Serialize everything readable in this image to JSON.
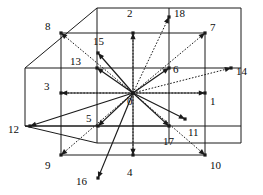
{
  "figure": {
    "name": "3d-lattice-neighborhood-graph",
    "type": "diagram",
    "background_color": "#ffffff",
    "line_color": "#1a1a1a",
    "label_color": "#0d0d0d",
    "center_node": "0",
    "projection": {
      "depth_dx": 36,
      "depth_dy": -25,
      "cell": 36
    },
    "node_count": 19
  },
  "nodes": [
    {
      "id": "0",
      "label": "0",
      "x": 133,
      "y": 93,
      "lx": 127,
      "ly": 96,
      "marker": true
    },
    {
      "id": "1",
      "label": "1",
      "x": 205,
      "y": 93,
      "lx": 210,
      "ly": 96,
      "marker": true
    },
    {
      "id": "2",
      "label": "2",
      "x": 133,
      "y": 33,
      "lx": 127,
      "ly": 8,
      "marker": true
    },
    {
      "id": "3",
      "label": "3",
      "x": 61,
      "y": 93,
      "lx": 44,
      "ly": 81,
      "marker": true
    },
    {
      "id": "4",
      "label": "4",
      "x": 133,
      "y": 155,
      "lx": 127,
      "ly": 167,
      "marker": true
    },
    {
      "id": "5",
      "label": "5",
      "x": 98,
      "y": 126,
      "lx": 86,
      "ly": 113,
      "marker": true
    },
    {
      "id": "6",
      "label": "6",
      "x": 169,
      "y": 68,
      "lx": 173,
      "ly": 64,
      "marker": true
    },
    {
      "id": "7",
      "label": "7",
      "x": 205,
      "y": 33,
      "lx": 210,
      "ly": 22,
      "marker": true
    },
    {
      "id": "8",
      "label": "8",
      "x": 61,
      "y": 33,
      "lx": 45,
      "ly": 21,
      "marker": true
    },
    {
      "id": "9",
      "label": "9",
      "x": 61,
      "y": 155,
      "lx": 45,
      "ly": 160,
      "marker": true
    },
    {
      "id": "10",
      "label": "10",
      "x": 205,
      "y": 155,
      "lx": 210,
      "ly": 160,
      "marker": true
    },
    {
      "id": "11",
      "label": "11",
      "x": 185,
      "y": 119,
      "lx": 188,
      "ly": 127,
      "marker": true
    },
    {
      "id": "12",
      "label": "12",
      "x": 30,
      "y": 126,
      "lx": 8,
      "ly": 124,
      "marker": true
    },
    {
      "id": "13",
      "label": "13",
      "x": 97,
      "y": 68,
      "lx": 70,
      "ly": 56,
      "marker": true
    },
    {
      "id": "14",
      "label": "14",
      "x": 231,
      "y": 68,
      "lx": 236,
      "ly": 66,
      "marker": true
    },
    {
      "id": "15",
      "label": "15",
      "x": 98,
      "y": 53,
      "lx": 93,
      "ly": 36,
      "marker": true
    },
    {
      "id": "16",
      "label": "16",
      "x": 98,
      "y": 178,
      "lx": 76,
      "ly": 176,
      "marker": true
    },
    {
      "id": "17",
      "label": "17",
      "x": 169,
      "y": 126,
      "lx": 163,
      "ly": 136,
      "marker": true
    },
    {
      "id": "18",
      "label": "18",
      "x": 169,
      "y": 17,
      "lx": 174,
      "ly": 8,
      "marker": true
    }
  ],
  "frame_edges": [
    {
      "from": [
        61,
        33
      ],
      "to": [
        205,
        33
      ],
      "style": "solid"
    },
    {
      "from": [
        61,
        33
      ],
      "to": [
        61,
        155
      ],
      "style": "solid"
    },
    {
      "from": [
        205,
        33
      ],
      "to": [
        205,
        155
      ],
      "style": "solid"
    },
    {
      "from": [
        61,
        155
      ],
      "to": [
        205,
        155
      ],
      "style": "solid"
    },
    {
      "from": [
        61,
        93
      ],
      "to": [
        205,
        93
      ],
      "style": "solid"
    },
    {
      "from": [
        133,
        33
      ],
      "to": [
        133,
        155
      ],
      "style": "solid"
    },
    {
      "from": [
        97,
        8
      ],
      "to": [
        97,
        143
      ],
      "style": "solid"
    },
    {
      "from": [
        169,
        8
      ],
      "to": [
        169,
        143
      ],
      "style": "solid"
    },
    {
      "from": [
        25,
        68
      ],
      "to": [
        241,
        68
      ],
      "style": "solid"
    },
    {
      "from": [
        25,
        126
      ],
      "to": [
        241,
        126
      ],
      "style": "solid"
    },
    {
      "from": [
        97,
        8
      ],
      "to": [
        241,
        8
      ],
      "style": "solid"
    },
    {
      "from": [
        25,
        68
      ],
      "to": [
        97,
        8
      ],
      "style": "solid"
    },
    {
      "from": [
        25,
        126
      ],
      "to": [
        25,
        68
      ],
      "style": "solid"
    },
    {
      "from": [
        241,
        8
      ],
      "to": [
        241,
        126
      ],
      "style": "solid"
    },
    {
      "from": [
        25,
        126
      ],
      "to": [
        169,
        126
      ],
      "style": "solid"
    },
    {
      "from": [
        97,
        143
      ],
      "to": [
        241,
        143
      ],
      "style": "solid"
    },
    {
      "from": [
        25,
        126
      ],
      "to": [
        97,
        143
      ],
      "style": "solid"
    },
    {
      "from": [
        241,
        126
      ],
      "to": [
        241,
        143
      ],
      "style": "solid"
    }
  ],
  "arrows": [
    {
      "to_node": "1",
      "style": "dotted"
    },
    {
      "to_node": "2",
      "style": "dotted"
    },
    {
      "to_node": "3",
      "style": "dotted"
    },
    {
      "to_node": "4",
      "style": "dotted"
    },
    {
      "to_node": "5",
      "style": "solid"
    },
    {
      "to_node": "6",
      "style": "solid"
    },
    {
      "to_node": "7",
      "style": "dotted"
    },
    {
      "to_node": "8",
      "style": "dotted"
    },
    {
      "to_node": "9",
      "style": "dotted"
    },
    {
      "to_node": "10",
      "style": "dotted"
    },
    {
      "to_node": "11",
      "style": "solid"
    },
    {
      "to_node": "12",
      "style": "solid"
    },
    {
      "to_node": "13",
      "style": "solid"
    },
    {
      "to_node": "14",
      "style": "dotted"
    },
    {
      "to_node": "15",
      "style": "solid"
    },
    {
      "to_node": "16",
      "style": "solid"
    },
    {
      "to_node": "17",
      "style": "solid"
    },
    {
      "to_node": "18",
      "style": "dotted"
    }
  ]
}
